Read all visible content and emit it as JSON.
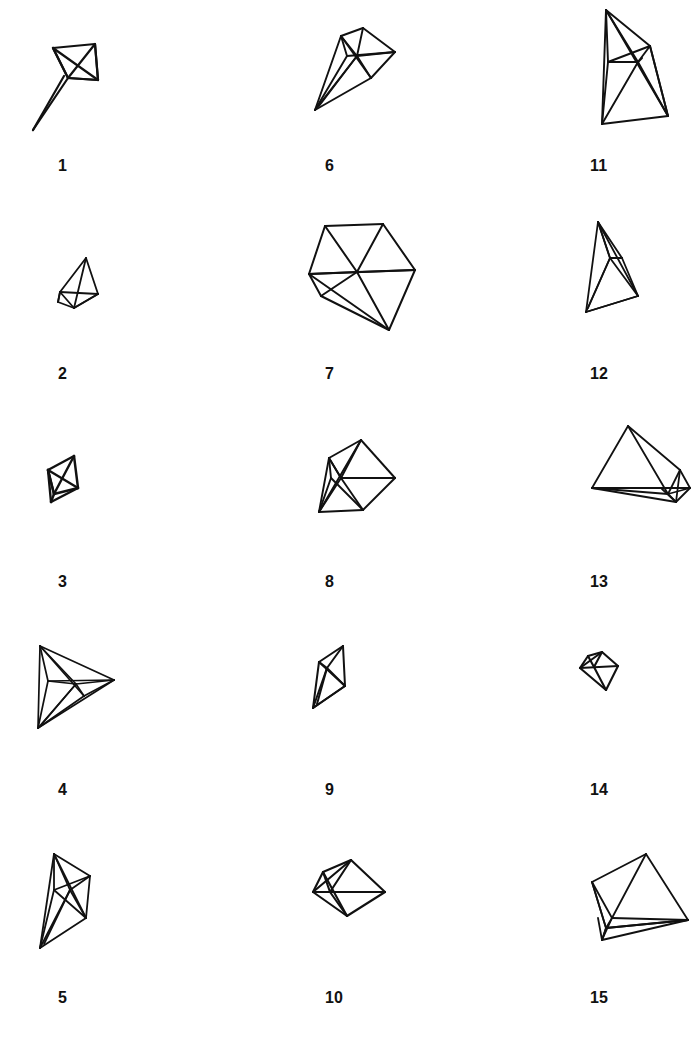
{
  "figure": {
    "kind": "line-drawing-plate",
    "background_color": "#ffffff",
    "stroke_color": "#111111",
    "columns": 3,
    "rows": 5,
    "item_count": 15,
    "labels": [
      "1",
      "2",
      "3",
      "4",
      "5",
      "6",
      "7",
      "8",
      "9",
      "10",
      "11",
      "12",
      "13",
      "14",
      "15"
    ]
  },
  "items": [
    {
      "label": "1",
      "name": "polyhedron-1",
      "column": 1,
      "row": 1,
      "stroke_width": 2.2,
      "viewbox": "0 0 230 160",
      "edges": [
        "M 35 48 L 77 44",
        "M 77 44 L 80 80",
        "M 80 80 L 50 78",
        "M 50 78 L 35 48",
        "M 35 48 L 50 78",
        "M 50 78 L 77 44",
        "M 77 44 L 80 80",
        "M 50 78 L 80 80",
        "M 50 78 L 15 130",
        "M 46 76 L 15 130",
        "M 35 48 L 80 80"
      ]
    },
    {
      "label": "2",
      "name": "polyhedron-2",
      "column": 1,
      "row": 2,
      "stroke_width": 1.8,
      "viewbox": "0 0 230 160",
      "edges": [
        "M 68 50 L 80 86",
        "M 80 86 L 56 100",
        "M 56 100 L 68 50",
        "M 56 100 L 42 84",
        "M 42 84 L 40 94",
        "M 40 94 L 56 100",
        "M 42 84 L 68 50",
        "M 42 84 L 80 86",
        "M 40 94 L 42 84",
        "M 56 100 L 80 86"
      ]
    },
    {
      "label": "3",
      "name": "polyhedron-3",
      "column": 1,
      "row": 3,
      "stroke_width": 2.4,
      "viewbox": "0 0 230 160",
      "edges": [
        "M 56 40 L 60 72",
        "M 60 72 L 36 78",
        "M 36 78 L 30 54",
        "M 30 54 L 56 40",
        "M 30 54 L 60 72",
        "M 36 78 L 56 40",
        "M 36 78 L 30 54",
        "M 36 78 L 33 86",
        "M 33 86 L 30 54",
        "M 33 86 L 60 72"
      ]
    },
    {
      "label": "4",
      "name": "polyhedron-4",
      "column": 1,
      "row": 4,
      "stroke_width": 1.7,
      "viewbox": "0 0 230 160",
      "edges": [
        "M 22 22 L 96 56",
        "M 96 56 L 20 104",
        "M 20 104 L 22 22",
        "M 22 22 L 58 60",
        "M 58 60 L 96 56",
        "M 58 60 L 20 104",
        "M 30 57 L 96 56",
        "M 22 22 L 30 57",
        "M 30 57 L 20 104",
        "M 30 57 L 58 60",
        "M 58 60 L 66 72",
        "M 66 72 L 96 56",
        "M 66 72 L 20 104",
        "M 22 22 L 66 72",
        "M 24 100 L 58 60"
      ]
    },
    {
      "label": "5",
      "name": "polyhedron-5",
      "column": 1,
      "row": 5,
      "stroke_width": 1.8,
      "viewbox": "0 0 230 160",
      "edges": [
        "M 36 22 L 72 44",
        "M 72 44 L 68 86",
        "M 68 86 L 22 116",
        "M 22 116 L 36 22",
        "M 36 22 L 52 58",
        "M 52 58 L 72 44",
        "M 52 58 L 68 86",
        "M 52 58 L 22 116",
        "M 36 58 L 72 44",
        "M 36 22 L 36 58",
        "M 36 58 L 22 116",
        "M 36 58 L 68 86",
        "M 36 22 L 68 86",
        "M 26 112 L 52 58"
      ]
    },
    {
      "label": "6",
      "name": "polyhedron-6",
      "column": 2,
      "row": 1,
      "stroke_width": 1.9,
      "viewbox": "0 0 230 160",
      "edges": [
        "M 78 28 L 110 52",
        "M 110 52 L 86 78",
        "M 86 78 L 30 110",
        "M 30 110 L 56 36",
        "M 56 36 L 78 28",
        "M 56 36 L 72 56",
        "M 72 56 L 110 52",
        "M 72 56 L 78 28",
        "M 72 56 L 86 78",
        "M 72 56 L 30 110",
        "M 56 36 L 62 56",
        "M 62 56 L 110 52",
        "M 62 56 L 30 110",
        "M 56 36 L 86 78",
        "M 34 106 L 72 56"
      ]
    },
    {
      "label": "7",
      "name": "polyhedron-7",
      "column": 2,
      "row": 2,
      "stroke_width": 2.0,
      "viewbox": "0 0 230 160",
      "edges": [
        "M 40 18 L 98 16",
        "M 98 16 L 130 62",
        "M 130 62 L 104 122",
        "M 104 122 L 24 66",
        "M 24 66 L 40 18",
        "M 24 66 L 130 62",
        "M 40 18 L 72 64",
        "M 98 16 L 72 64",
        "M 72 64 L 104 122",
        "M 72 64 L 24 66",
        "M 72 64 L 130 62",
        "M 36 88 L 72 64",
        "M 24 66 L 36 88",
        "M 36 88 L 104 122"
      ]
    },
    {
      "label": "8",
      "name": "polyhedron-8",
      "column": 2,
      "row": 3,
      "stroke_width": 1.9,
      "viewbox": "0 0 230 160",
      "edges": [
        "M 76 24 L 110 62",
        "M 110 62 L 78 94",
        "M 78 94 L 34 96",
        "M 34 96 L 44 42",
        "M 44 42 L 76 24",
        "M 44 42 L 56 62",
        "M 56 62 L 110 62",
        "M 56 62 L 76 24",
        "M 56 62 L 78 94",
        "M 56 62 L 34 96",
        "M 44 42 L 46 62",
        "M 46 62 L 78 94",
        "M 46 62 L 34 96",
        "M 76 24 L 34 96",
        "M 56 62 L 44 42"
      ]
    },
    {
      "label": "9",
      "name": "polyhedron-9",
      "column": 2,
      "row": 4,
      "stroke_width": 2.0,
      "viewbox": "0 0 230 160",
      "edges": [
        "M 58 22 L 60 62",
        "M 60 62 L 28 84",
        "M 28 84 L 34 38",
        "M 34 38 L 58 22",
        "M 34 38 L 42 44",
        "M 42 44 L 58 22",
        "M 42 44 L 60 62",
        "M 42 44 L 28 84",
        "M 34 38 L 60 62",
        "M 32 80 L 42 44",
        "M 28 84 L 60 62"
      ]
    },
    {
      "label": "10",
      "name": "polyhedron-10",
      "column": 2,
      "row": 5,
      "stroke_width": 2.1,
      "viewbox": "0 0 230 160",
      "edges": [
        "M 66 28 L 100 60",
        "M 100 60 L 62 84",
        "M 62 84 L 28 60",
        "M 28 60 L 38 40",
        "M 38 40 L 66 28",
        "M 28 60 L 100 60",
        "M 38 40 L 45 60",
        "M 45 60 L 66 28",
        "M 45 60 L 62 84",
        "M 45 60 L 100 60",
        "M 28 60 L 45 60",
        "M 38 40 L 62 84",
        "M 66 28 L 28 60"
      ]
    },
    {
      "label": "11",
      "name": "polyhedron-11",
      "column": 3,
      "row": 1,
      "stroke_width": 1.9,
      "viewbox": "0 0 230 160",
      "edges": [
        "M 56 10 L 100 46",
        "M 100 46 L 118 116",
        "M 118 116 L 52 124",
        "M 52 124 L 56 10",
        "M 56 10 L 88 62",
        "M 88 62 L 100 46",
        "M 88 62 L 118 116",
        "M 88 62 L 52 124",
        "M 58 62 L 100 46",
        "M 56 10 L 58 62",
        "M 58 62 L 52 124",
        "M 58 62 L 88 62",
        "M 88 62 L 92 58",
        "M 56 10 L 118 116",
        "M 100 46 L 118 116"
      ]
    },
    {
      "label": "12",
      "name": "polyhedron-12",
      "column": 3,
      "row": 2,
      "stroke_width": 1.8,
      "viewbox": "0 0 230 160",
      "edges": [
        "M 48 14 L 72 50",
        "M 72 50 L 88 88",
        "M 88 88 L 36 104",
        "M 36 104 L 48 14",
        "M 48 14 L 60 50",
        "M 60 50 L 72 50",
        "M 60 50 L 88 88",
        "M 60 50 L 36 104",
        "M 48 14 L 88 88",
        "M 38 100 L 60 50",
        "M 36 104 L 88 88",
        "M 60 50 L 48 14"
      ]
    },
    {
      "label": "13",
      "name": "polyhedron-13",
      "column": 3,
      "row": 3,
      "stroke_width": 1.8,
      "viewbox": "0 0 230 160",
      "edges": [
        "M 78 10 L 130 54",
        "M 130 54 L 140 72",
        "M 140 72 L 126 86",
        "M 126 86 L 42 72",
        "M 42 72 L 78 10",
        "M 42 72 L 140 72",
        "M 78 10 L 118 78",
        "M 118 78 L 130 54",
        "M 118 78 L 140 72",
        "M 118 78 L 126 86",
        "M 118 78 L 42 72",
        "M 130 54 L 126 86",
        "M 112 73 L 126 86"
      ]
    },
    {
      "label": "14",
      "name": "polyhedron-14",
      "column": 3,
      "row": 4,
      "stroke_width": 2.1,
      "viewbox": "0 0 230 160",
      "edges": [
        "M 52 28 L 68 42",
        "M 68 42 L 56 66",
        "M 56 66 L 30 44",
        "M 30 44 L 38 32",
        "M 38 32 L 52 28",
        "M 30 44 L 68 42",
        "M 44 43 L 52 28",
        "M 44 43 L 56 66",
        "M 38 32 L 44 43",
        "M 52 28 L 30 44"
      ]
    },
    {
      "label": "15",
      "name": "polyhedron-15",
      "column": 3,
      "row": 5,
      "stroke_width": 1.8,
      "viewbox": "0 0 230 160",
      "edges": [
        "M 96 22 L 138 88",
        "M 138 88 L 56 96",
        "M 56 96 L 42 50",
        "M 42 50 L 96 22",
        "M 42 50 L 56 96",
        "M 56 96 L 138 88",
        "M 96 22 L 62 86",
        "M 62 86 L 138 88",
        "M 62 86 L 56 96",
        "M 62 86 L 42 50",
        "M 52 108 L 62 86",
        "M 52 108 L 56 96",
        "M 52 108 L 138 88",
        "M 56 96 L 52 108",
        "M 48 86 L 52 108"
      ]
    }
  ]
}
